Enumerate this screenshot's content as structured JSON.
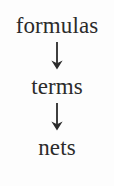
{
  "diagram": {
    "type": "vertical-flow",
    "orientation": "top-to-bottom",
    "background_color": "#fdfdfd",
    "text_color": "#2b2b2b",
    "nodes": [
      {
        "id": "formulas",
        "label": "formulas"
      },
      {
        "id": "terms",
        "label": "terms"
      },
      {
        "id": "nets",
        "label": "nets"
      }
    ],
    "connectors": [
      {
        "id": "arrow-1",
        "glyph": "↓",
        "from": "formulas",
        "to": "terms"
      },
      {
        "id": "arrow-2",
        "glyph": "↓",
        "from": "terms",
        "to": "nets"
      }
    ]
  }
}
